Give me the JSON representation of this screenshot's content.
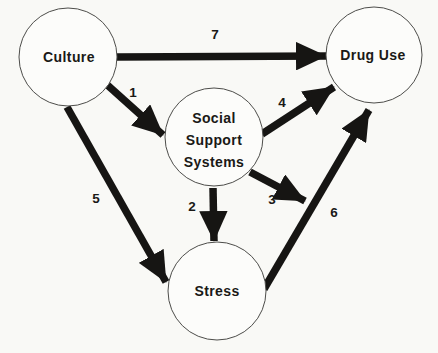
{
  "diagram": {
    "background_color": "#f9f9f6",
    "ink_color": "#161513",
    "circle_stroke_color": "#4d4d4a",
    "nodes": {
      "culture": {
        "label": "Culture"
      },
      "drug_use": {
        "label": "Drug Use"
      },
      "social_support": {
        "line1": "Social",
        "line2": "Support",
        "line3": "Systems"
      },
      "stress": {
        "label": "Stress"
      }
    },
    "edges": {
      "e1": {
        "label": "1",
        "from": "Culture",
        "to": "Social Support Systems"
      },
      "e2": {
        "label": "2",
        "from": "Social Support Systems",
        "to": "Stress"
      },
      "e3": {
        "label": "3",
        "from": "Social Support Systems",
        "to": "Stress-to-Drug Use path"
      },
      "e4": {
        "label": "4",
        "from": "Social Support Systems",
        "to": "Drug Use"
      },
      "e5": {
        "label": "5",
        "from": "Culture",
        "to": "Stress"
      },
      "e6": {
        "label": "6",
        "from": "Stress",
        "to": "Drug Use"
      },
      "e7": {
        "label": "7",
        "from": "Culture",
        "to": "Drug Use"
      }
    }
  }
}
